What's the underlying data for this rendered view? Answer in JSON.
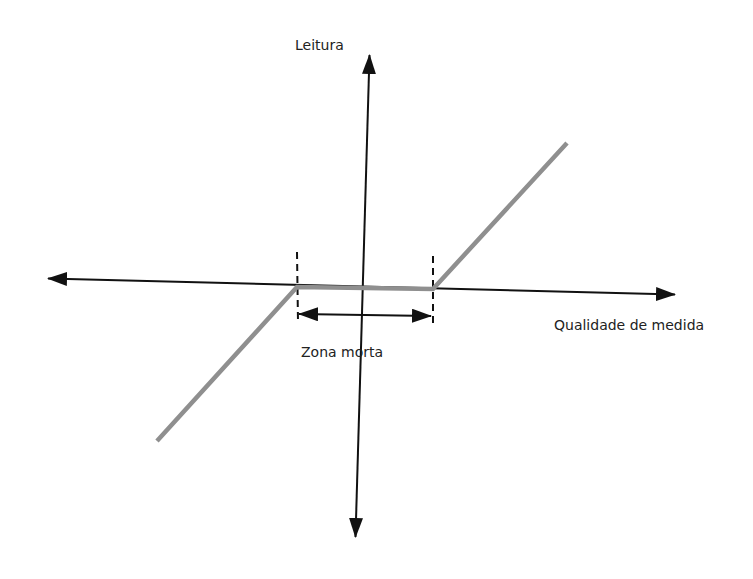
{
  "diagram": {
    "type": "dead-zone characteristic",
    "labels": {
      "y_axis": "Leitura",
      "x_axis": "Qualidade de medida",
      "dead_zone": "Zona morta"
    },
    "colors": {
      "axis": "#111111",
      "response_line": "#8f8f8f",
      "dashed": "#111111",
      "text": "#222222"
    },
    "axes": {
      "x": {
        "from": [
          30,
          278
        ],
        "to": [
          693,
          295
        ]
      },
      "y": {
        "from": [
          355,
          555
        ],
        "to": [
          370,
          37
        ]
      }
    },
    "response_curve": {
      "points": [
        [
          157,
          441
        ],
        [
          297,
          287
        ],
        [
          433,
          289
        ],
        [
          567,
          143
        ]
      ]
    },
    "dead_zone": {
      "left_x": 297,
      "right_x": 433,
      "dim_arrow_y": 315
    }
  }
}
